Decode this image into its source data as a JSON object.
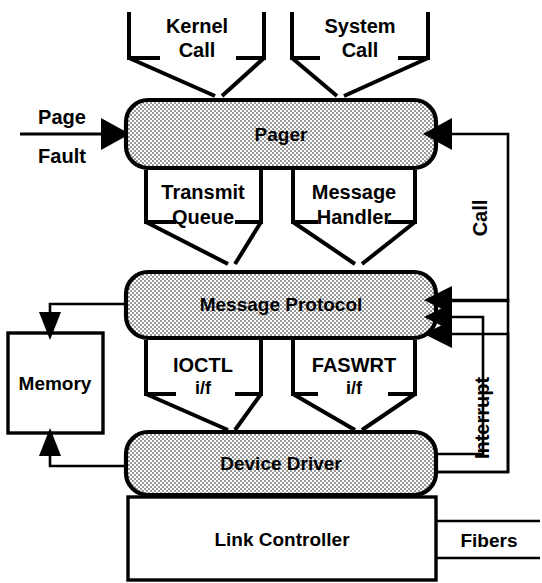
{
  "diagram": {
    "colors": {
      "line": "#000000",
      "shaded_fill": "#d8d8d8",
      "plain_fill": "#ffffff",
      "background": "#ffffff"
    }
  },
  "nodes": {
    "pager": {
      "label": "Pager",
      "style": "shaded-rounded"
    },
    "message_protocol": {
      "label": "Message Protocol",
      "style": "shaded-rounded"
    },
    "device_driver": {
      "label": "Device Driver",
      "style": "shaded-rounded"
    },
    "link_controller": {
      "label": "Link Controller",
      "style": "plain-rect"
    },
    "memory": {
      "label": "Memory",
      "style": "plain-rect"
    }
  },
  "inputs": {
    "kernel_call": {
      "line1": "Kernel",
      "line2": "Call"
    },
    "system_call": {
      "line1": "System",
      "line2": "Call"
    },
    "page_fault": {
      "line1": "Page",
      "line2": "Fault"
    },
    "fibers": {
      "label": "Fibers"
    }
  },
  "interfaces": {
    "transmit_queue": {
      "line1": "Transmit",
      "line2": "Queue"
    },
    "message_handler": {
      "line1": "Message",
      "line2": "Handler"
    },
    "ioctl": {
      "line1": "IOCTL",
      "line2": "i/f"
    },
    "faswrt": {
      "line1": "FASWRT",
      "line2": "i/f"
    }
  },
  "feedback": {
    "call": {
      "label": "Call",
      "orientation": "vertical-bottom-to-top"
    },
    "interrupt": {
      "label": "Interrupt",
      "orientation": "vertical-bottom-to-top"
    }
  }
}
